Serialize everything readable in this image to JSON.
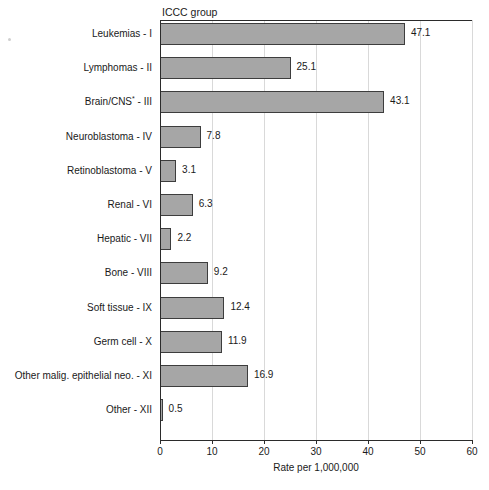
{
  "chart_data": {
    "type": "bar",
    "orientation": "horizontal",
    "title": "",
    "group_heading": "ICCC group",
    "xlabel": "Rate per 1,000,000",
    "ylabel": "",
    "xlim": [
      0,
      60
    ],
    "xticks": [
      0,
      10,
      20,
      30,
      40,
      50,
      60
    ],
    "xtick_labels": [
      "0",
      "10",
      "20",
      "30",
      "40",
      "50",
      "60"
    ],
    "grid": "vertical",
    "legend": "none",
    "bar_color": "#a6a6a6",
    "bar_border_color": "#3d3d3d",
    "gridline_color": "#d9d9d9",
    "axis_color": "#2b2b2b",
    "categories": [
      "Leukemias - I",
      "Lymphomas - II",
      "Brain/CNS* - III",
      "Neuroblastoma - IV",
      "Retinoblastoma - V",
      "Renal - VI",
      "Hepatic - VII",
      "Bone - VIII",
      "Soft tissue - IX",
      "Germ cell - X",
      "Other malig. epithelial neo. - XI",
      "Other - XII"
    ],
    "values": [
      47.1,
      25.1,
      43.1,
      7.8,
      3.1,
      6.3,
      2.2,
      9.2,
      12.4,
      11.9,
      16.9,
      0.5
    ],
    "value_labels": [
      "47.1",
      "25.1",
      "43.1",
      "7.8",
      "3.1",
      "6.3",
      "2.2",
      "9.2",
      "12.4",
      "11.9",
      "16.9",
      "0.5"
    ],
    "bars": [
      {
        "label_main": "Leukemias",
        "label_suffix": " - I",
        "has_asterisk": false,
        "value": 47.1,
        "value_label": "47.1"
      },
      {
        "label_main": "Lymphomas",
        "label_suffix": " - II",
        "has_asterisk": false,
        "value": 25.1,
        "value_label": "25.1"
      },
      {
        "label_main": "Brain/CNS",
        "label_suffix": " - III",
        "has_asterisk": true,
        "value": 43.1,
        "value_label": "43.1"
      },
      {
        "label_main": "Neuroblastoma",
        "label_suffix": " - IV",
        "has_asterisk": false,
        "value": 7.8,
        "value_label": "7.8"
      },
      {
        "label_main": "Retinoblastoma",
        "label_suffix": " - V",
        "has_asterisk": false,
        "value": 3.1,
        "value_label": "3.1"
      },
      {
        "label_main": "Renal",
        "label_suffix": " - VI",
        "has_asterisk": false,
        "value": 6.3,
        "value_label": "6.3"
      },
      {
        "label_main": "Hepatic",
        "label_suffix": " - VII",
        "has_asterisk": false,
        "value": 2.2,
        "value_label": "2.2"
      },
      {
        "label_main": "Bone",
        "label_suffix": " - VIII",
        "has_asterisk": false,
        "value": 9.2,
        "value_label": "9.2"
      },
      {
        "label_main": "Soft tissue",
        "label_suffix": " - IX",
        "has_asterisk": false,
        "value": 12.4,
        "value_label": "12.4"
      },
      {
        "label_main": "Germ cell",
        "label_suffix": " - X",
        "has_asterisk": false,
        "value": 11.9,
        "value_label": "11.9"
      },
      {
        "label_main": "Other malig. epithelial neo.",
        "label_suffix": " - XI",
        "has_asterisk": false,
        "value": 16.9,
        "value_label": "16.9"
      },
      {
        "label_main": "Other",
        "label_suffix": " - XII",
        "has_asterisk": false,
        "value": 0.5,
        "value_label": "0.5"
      }
    ]
  }
}
